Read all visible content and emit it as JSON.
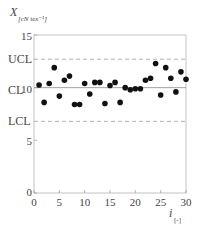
{
  "chart_data": {
    "type": "scatter",
    "title": "",
    "xlabel": "i",
    "xlabel_unit": "[-]",
    "ylabel": "X",
    "ylabel_unit": "[cN tex⁻¹]",
    "xlim": [
      0,
      30
    ],
    "ylim": [
      0,
      15
    ],
    "x_ticks": [
      0,
      5,
      10,
      15,
      20,
      25,
      30
    ],
    "y_ticks": [
      0,
      5,
      10,
      15
    ],
    "grid": false,
    "control_lines": [
      {
        "name": "UCL",
        "label": "UCL",
        "value": 12.7,
        "style": "dashed"
      },
      {
        "name": "CL",
        "label": "CL",
        "value": 10.0,
        "style": "solid"
      },
      {
        "name": "LCL",
        "label": "LCL",
        "value": 6.8,
        "style": "dashed"
      }
    ],
    "x": [
      1,
      2,
      3,
      4,
      5,
      6,
      7,
      8,
      9,
      10,
      11,
      12,
      13,
      14,
      15,
      16,
      17,
      18,
      19,
      20,
      21,
      22,
      23,
      24,
      25,
      26,
      27,
      28,
      29,
      30
    ],
    "values": [
      10.25,
      8.6,
      10.4,
      11.9,
      9.2,
      10.7,
      11.1,
      8.4,
      8.4,
      10.4,
      9.4,
      10.5,
      10.5,
      8.5,
      10.2,
      10.5,
      8.6,
      10.0,
      9.8,
      9.9,
      9.9,
      10.7,
      10.9,
      12.3,
      9.3,
      11.9,
      10.9,
      9.6,
      11.5,
      10.8
    ]
  },
  "labels": {
    "y_main": "X",
    "y_sub": "[cN tex⁻¹]",
    "x_main": "i",
    "x_sub": "[-]",
    "ucl": "UCL",
    "cl": "CL",
    "lcl": "LCL",
    "y15": "15",
    "y10": "10",
    "y5": "5",
    "y0": "0",
    "x0": "0",
    "x5": "5",
    "x10": "10",
    "x15": "15",
    "x20": "20",
    "x25": "25",
    "x30": "30"
  },
  "colors": {
    "axis": "#9a9a9a",
    "dashed": "#a0a0a0",
    "center": "#888888",
    "point": "#111111"
  }
}
